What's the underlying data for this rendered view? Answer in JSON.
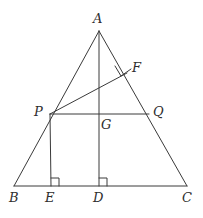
{
  "figure": {
    "width": 203,
    "height": 218,
    "background_color": "#ffffff",
    "stroke_color": "#3a3a3a",
    "label_color": "#2e2e2e",
    "stroke_width": 1
  },
  "points": [
    {
      "id": "A",
      "label": "A",
      "x": 99,
      "y": 31,
      "label_x": 93,
      "label_y": 12
    },
    {
      "id": "B",
      "label": "B",
      "x": 14,
      "y": 186,
      "label_x": 9,
      "label_y": 191
    },
    {
      "id": "C",
      "label": "C",
      "x": 187,
      "y": 186,
      "label_x": 186,
      "label_y": 191
    },
    {
      "id": "D",
      "label": "D",
      "x": 99,
      "y": 186,
      "label_x": 93,
      "label_y": 191
    },
    {
      "id": "E",
      "label": "E",
      "x": 51,
      "y": 186,
      "label_x": 45,
      "label_y": 191
    },
    {
      "id": "P",
      "label": "P",
      "x": 50,
      "y": 114,
      "label_x": 34,
      "label_y": 104
    },
    {
      "id": "Q",
      "label": "Q",
      "x": 149,
      "y": 114,
      "label_x": 153,
      "label_y": 104
    },
    {
      "id": "F",
      "label": "F",
      "x": 127,
      "y": 73,
      "label_x": 132,
      "label_y": 61
    },
    {
      "id": "G",
      "label": "G",
      "x": 99,
      "y": 114,
      "label_x": 101,
      "label_y": 117
    }
  ],
  "segments": [
    {
      "name": "side-AB",
      "from": "A",
      "to": "B"
    },
    {
      "name": "side-AC",
      "from": "A",
      "to": "C"
    },
    {
      "name": "side-BC",
      "from": "B",
      "to": "C"
    },
    {
      "name": "altitude-AD",
      "from": "A",
      "to": "D"
    },
    {
      "name": "segment-PQ",
      "from": "P",
      "to": "Q"
    },
    {
      "name": "perpendicular-PE",
      "from": "P",
      "to": "E"
    },
    {
      "name": "perpendicular-PF",
      "from": "P",
      "to": "F"
    }
  ],
  "right_angles": [
    {
      "name": "right-angle-at-E",
      "vertex": "E",
      "size": 8
    },
    {
      "name": "right-angle-at-D",
      "vertex": "D",
      "size": 8
    },
    {
      "name": "right-angle-at-F",
      "vertex": "F",
      "size": 8
    }
  ]
}
